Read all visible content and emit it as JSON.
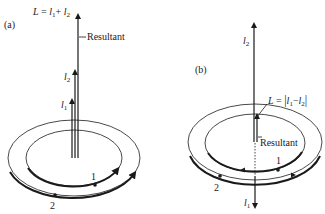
{
  "panel_a": {
    "label": "(a)",
    "total_label_L": "L",
    "total_label_eq": " = ",
    "total_label_l1": "l",
    "total_label_sub1": "1",
    "total_label_plus": "+ ",
    "total_label_l2": "l",
    "total_label_sub2": "2",
    "resultant_label": "Resultant",
    "vector_l2": "l",
    "vector_l2_sub": "2",
    "vector_l1": "l",
    "vector_l1_sub": "1",
    "orbit_inner_label": "1",
    "orbit_outer_label": "2"
  },
  "panel_b": {
    "label": "(b)",
    "vector_l2": "l",
    "vector_l2_sub": "2",
    "total_label_L": "L",
    "total_label_eq": " = ",
    "total_label_abs_open": "|",
    "total_label_l1": "l",
    "total_label_sub1": "1",
    "total_label_minus": "−",
    "total_label_l2": "l",
    "total_label_sub2": "2",
    "total_label_abs_close": "|",
    "resultant_label": "Resultant",
    "orbit_inner_label": "1",
    "orbit_outer_label": "2",
    "vector_l1": "l",
    "vector_l1_sub": "1"
  },
  "colors": {
    "ink": "#1a1a1a",
    "background": "#ffffff"
  }
}
